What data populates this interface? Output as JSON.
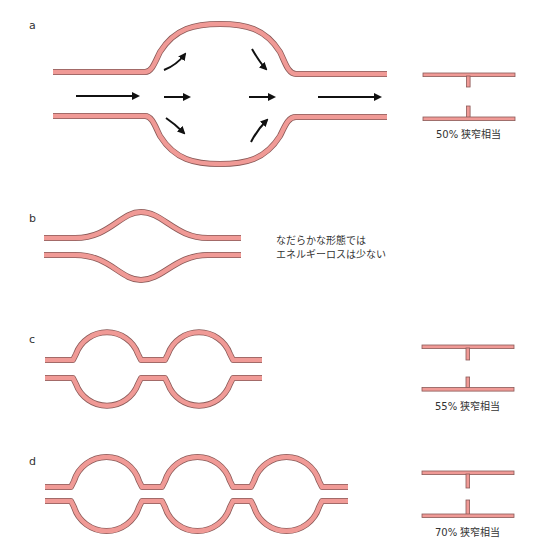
{
  "colors": {
    "vessel_fill": "#f09a96",
    "vessel_stroke": "#8a5a58",
    "arrow": "#111111",
    "text": "#333333",
    "background": "#ffffff"
  },
  "panels": [
    {
      "id": "a",
      "label": "a",
      "description": "large single aneurysmal dilation with recirculating flow arrows",
      "stenosis_caption": "50% 狭窄相当"
    },
    {
      "id": "b",
      "label": "b",
      "description": "gentle fusiform dilation",
      "note_line1": "なだらかな形態では",
      "note_line2": "エネルギーロスは少ない"
    },
    {
      "id": "c",
      "label": "c",
      "description": "two sequential saccular dilations",
      "stenosis_caption": "55% 狭窄相当"
    },
    {
      "id": "d",
      "label": "d",
      "description": "three sequential saccular dilations",
      "stenosis_caption": "70% 狭窄相当"
    }
  ],
  "icons": {
    "flow_arrow": "flow-arrow-icon"
  }
}
